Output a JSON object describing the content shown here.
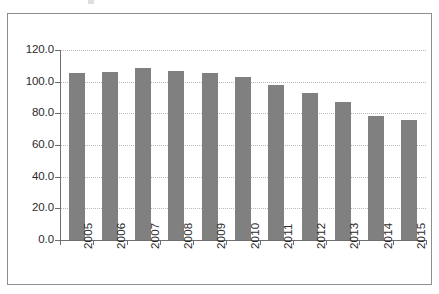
{
  "chart_data": {
    "type": "bar",
    "title": "",
    "subtitle": "",
    "xlabel": "",
    "ylabel": "",
    "categories": [
      "2005",
      "2006",
      "2007",
      "2008",
      "2009",
      "2010",
      "2011",
      "2012",
      "2013",
      "2014",
      "2015"
    ],
    "values": [
      105.5,
      106.0,
      108.5,
      107.0,
      105.5,
      103.0,
      98.0,
      93.0,
      87.0,
      78.5,
      75.5
    ],
    "series": [
      {
        "name": "",
        "values": [
          105.5,
          106.0,
          108.5,
          107.0,
          105.5,
          103.0,
          98.0,
          93.0,
          87.0,
          78.5,
          75.5
        ]
      }
    ],
    "ylim": [
      0.0,
      120.0
    ],
    "ytick_values": [
      0.0,
      20.0,
      40.0,
      60.0,
      80.0,
      100.0,
      120.0
    ],
    "ytick_labels": [
      "0.0",
      "20.0",
      "40.0",
      "60.0",
      "80.0",
      "100.0",
      "120.0"
    ],
    "xtick_labels": [
      "2005",
      "2006",
      "2007",
      "2008",
      "2009",
      "2010",
      "2011",
      "2012",
      "2013",
      "2014",
      "2015"
    ],
    "xtick_label_rotation": 90,
    "grid": true,
    "grid_axis": "y",
    "grid_style": "dotted",
    "legend": false,
    "legend_position": "none",
    "annotations": [],
    "colors": {
      "bar": "#808080",
      "gridline": "#b9b9b9",
      "axis": "#6f6f6f",
      "text": "#2b2b2b",
      "background": "#ffffff",
      "frame": "#8e8e8e"
    }
  }
}
